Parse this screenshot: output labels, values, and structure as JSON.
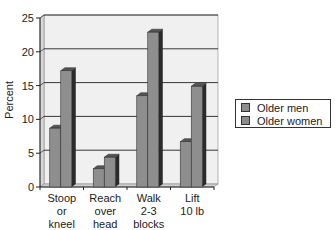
{
  "chart_data": {
    "type": "bar",
    "title": "",
    "xlabel": "",
    "ylabel": "Percent",
    "ylim": [
      0,
      25
    ],
    "yticks": [
      0,
      5,
      10,
      15,
      20,
      25
    ],
    "grid": true,
    "legend_position": "right",
    "categories": [
      "Stoop or kneel",
      "Reach over head",
      "Walk 2-3 blocks",
      "Lift 10 lb"
    ],
    "category_lines": [
      [
        "Stoop",
        "or",
        "kneel"
      ],
      [
        "Reach",
        "over",
        "head"
      ],
      [
        "Walk",
        "2-3",
        "blocks"
      ],
      [
        "Lift",
        "10 lb"
      ]
    ],
    "series": [
      {
        "name": "Older men",
        "values": [
          8.7,
          2.7,
          13.5,
          6.7
        ]
      },
      {
        "name": "Older women",
        "values": [
          17.2,
          4.4,
          22.9,
          14.9
        ]
      }
    ]
  },
  "colors": {
    "bar_face": "#8e8e8e",
    "bar_side": "#2a2a2a",
    "bar_top": "#555555",
    "plot_bg": "#f0f0f0",
    "grid": "#222222"
  },
  "legend": {
    "items": [
      {
        "label": "Older men"
      },
      {
        "label": "Older women"
      }
    ]
  }
}
